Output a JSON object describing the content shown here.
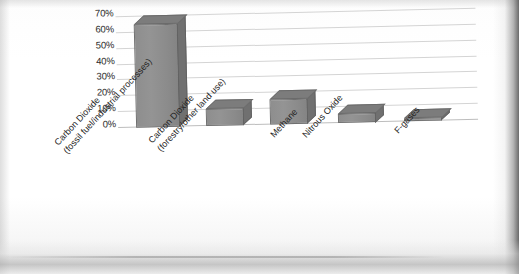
{
  "chart_data": {
    "type": "bar",
    "title": "",
    "subtitle": "",
    "xlabel": "",
    "ylabel": "",
    "categories": [
      "Carbon Dioxide\n(fossil fuel/industrial processes)",
      "Carbon Dioxide\n(forestry/other land use)",
      "Methane",
      "Nitrous Oxide",
      "F-gases"
    ],
    "category_lines": [
      [
        "Carbon Dioxide",
        "(fossil fuel/industrial processes)"
      ],
      [
        "Carbon Dioxide",
        "(forestry/other land use)"
      ],
      [
        "Methane",
        ""
      ],
      [
        "Nitrous Oxide",
        ""
      ],
      [
        "F-gases",
        ""
      ]
    ],
    "values": [
      65,
      11,
      16,
      6,
      2
    ],
    "ylim": [
      0,
      70
    ],
    "ytick_values": [
      0,
      10,
      20,
      30,
      40,
      50,
      60,
      70
    ],
    "ytick_labels": [
      "0%",
      "10%",
      "20%",
      "30%",
      "40%",
      "50%",
      "60%",
      "70%"
    ],
    "grid": true,
    "legend": false,
    "legend_position": "none",
    "style": "3d-column",
    "bar_color": "#8e8e8e",
    "bar_top_color": "#7c7c7c",
    "bar_side_color": "#707070",
    "bar_edge_color": "#6f6f6f",
    "gridline_color": "#d4d4d4",
    "axis_color": "#bdbdbd",
    "background_color": "#ffffff",
    "text_color": "#1f1f1f"
  }
}
